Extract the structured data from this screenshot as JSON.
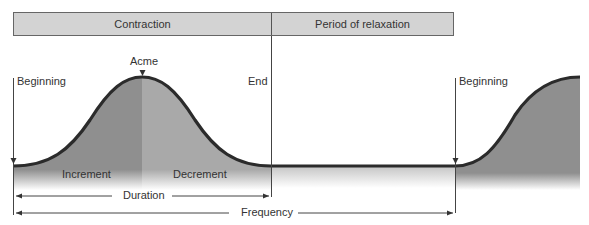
{
  "header": {
    "phases": [
      {
        "label": "Contraction"
      },
      {
        "label": "Period of relaxation"
      }
    ]
  },
  "labels": {
    "acme": "Acme",
    "beginning_1": "Beginning",
    "end": "End",
    "beginning_2": "Beginning",
    "increment": "Increment",
    "decrement": "Decrement",
    "duration": "Duration",
    "frequency": "Frequency"
  },
  "colors": {
    "header_fill": "#d3d3d3",
    "increment_fill": "#8f8f8f",
    "decrement_fill": "#a8a8a8",
    "curve_stroke": "#2b2b2b",
    "line_stroke": "#444444"
  }
}
